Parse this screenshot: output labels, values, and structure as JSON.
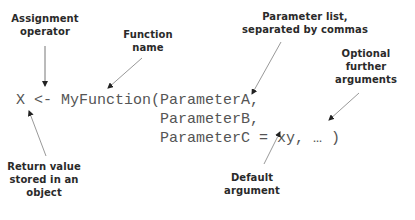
{
  "diagram": {
    "code": {
      "line1_prefix": "X <- ",
      "line1_function": "MyFunction",
      "line1_open": "(",
      "line1_param": "ParameterA,",
      "line2_param": "ParameterB,",
      "line3_param": "ParameterC = xy, … )"
    },
    "annotations": {
      "assignment_operator": [
        "Assignment",
        "operator"
      ],
      "function_name": [
        "Function",
        "name"
      ],
      "parameter_list": [
        "Parameter list,",
        "separated by commas"
      ],
      "optional_arguments": [
        "Optional",
        "further",
        "arguments"
      ],
      "return_value": [
        "Return value",
        "stored in an",
        "object"
      ],
      "default_argument": [
        "Default",
        "argument"
      ]
    },
    "colors": {
      "code_text": "#555555",
      "label_text": "#2a2a2a",
      "arrow": "#777777"
    }
  }
}
